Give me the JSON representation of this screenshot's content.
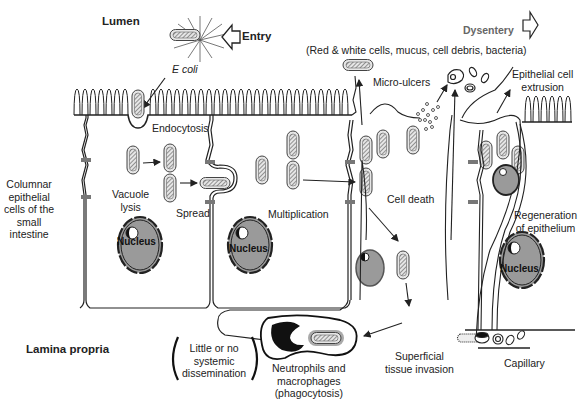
{
  "diagram": {
    "regions": {
      "lumen": "Lumen",
      "lamina_propria": "Lamina propria",
      "epithelium": [
        "Columnar",
        "epithelial",
        "cells of the",
        "small",
        "intestine"
      ]
    },
    "organism": "E coli",
    "entry_label": "Entry",
    "dysentery_label": "Dysentery",
    "dysentery_contents": "(Red & white cells, mucus, cell debris, bacteria)",
    "steps": {
      "endocytosis": "Endocytosis",
      "vacuole_lysis": [
        "Vacuole",
        "lysis"
      ],
      "spread": "Spread",
      "multiplication": "Multiplication",
      "cell_death": "Cell death",
      "micro_ulcers": "Micro-ulcers",
      "extrusion": [
        "Epithelial cell",
        "extrusion"
      ],
      "regeneration": [
        "Regeneration",
        "of epithelium"
      ],
      "superficial_invasion": [
        "Superficial",
        "tissue invasion"
      ],
      "phagocytosis": [
        "Neutrophils and",
        "macrophages",
        "(phagocytosis)"
      ],
      "dissemination": [
        "Little or no",
        "systemic",
        "dissemination"
      ],
      "capillary": "Capillary"
    },
    "nucleus_label": "Nucleus",
    "colors": {
      "line": "#222222",
      "nucleus_fill": "#9a9a9a",
      "bacterium_fill": "#e6e6e6",
      "text_gray": "#666666"
    }
  }
}
